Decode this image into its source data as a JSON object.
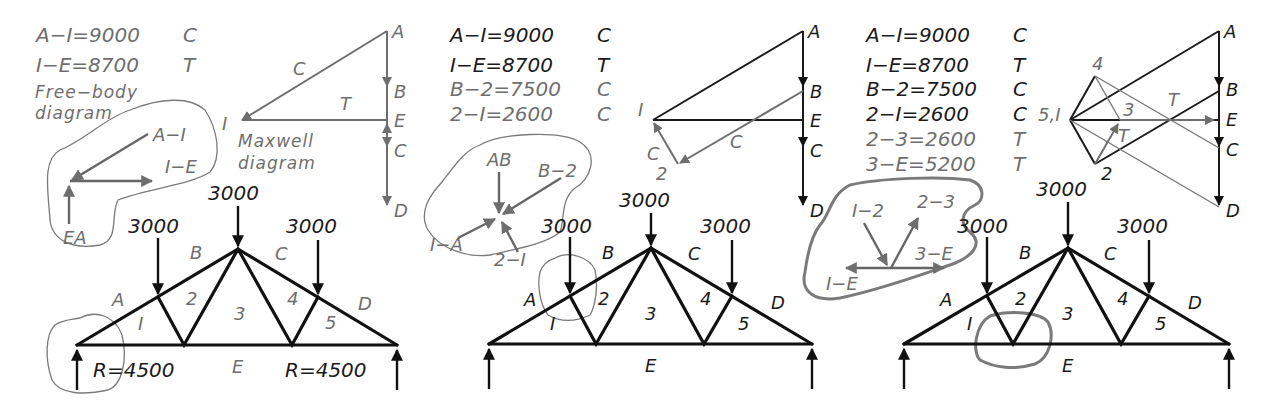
{
  "figure": {
    "colors": {
      "known_members": "#1a1a1a",
      "current_step": "#6e6e6e",
      "background": "#ffffff"
    }
  },
  "panels": [
    {
      "id": "step-1",
      "results": [
        {
          "member": "A-I",
          "value": "A−I=9000",
          "type": "C"
        },
        {
          "member": "I-E",
          "value": "I−E=8700",
          "type": "T"
        }
      ],
      "free_body_caption": [
        "Free−body",
        "diagram"
      ],
      "maxwell_caption": [
        "Maxwell",
        "diagram"
      ],
      "free_body_labels": {
        "a": "A−I",
        "b": "I−E",
        "c": "EA"
      },
      "maxwell_labels": {
        "A": "A",
        "B": "B",
        "E": "E",
        "C": "C",
        "D": "D",
        "I": "I",
        "c_mark": "C",
        "t_mark": "T"
      },
      "truss": {
        "loads": [
          "3000",
          "3000",
          "3000"
        ],
        "reactions": [
          "R=4500",
          "R=4500"
        ],
        "space_labels": {
          "A": "A",
          "B": "B",
          "C": "C",
          "D": "D",
          "E": "E"
        },
        "panel_labels": [
          "I",
          "2",
          "3",
          "4",
          "5"
        ]
      }
    },
    {
      "id": "step-2",
      "results": [
        {
          "member": "A-I",
          "value": "A−I=9000",
          "type": "C"
        },
        {
          "member": "I-E",
          "value": "I−E=8700",
          "type": "T"
        },
        {
          "member": "B-2",
          "value": "B−2=7500",
          "type": "C"
        },
        {
          "member": "2-I",
          "value": "2−I=2600",
          "type": "C"
        }
      ],
      "free_body_labels": {
        "a": "AB",
        "b": "B−2",
        "c": "I−A",
        "d": "2−I"
      },
      "maxwell_labels": {
        "A": "A",
        "B": "B",
        "E": "E",
        "C": "C",
        "D": "D",
        "I": "I",
        "two": "2",
        "c_mark1": "C",
        "c_mark2": "C"
      },
      "truss": {
        "loads": [
          "3000",
          "3000",
          "3000"
        ],
        "space_labels": {
          "A": "A",
          "B": "B",
          "C": "C",
          "D": "D",
          "E": "E"
        },
        "panel_labels": [
          "I",
          "2",
          "3",
          "4",
          "5"
        ]
      }
    },
    {
      "id": "step-3",
      "results": [
        {
          "member": "A-I",
          "value": "A−I=9000",
          "type": "C"
        },
        {
          "member": "I-E",
          "value": "I−E=8700",
          "type": "T"
        },
        {
          "member": "B-2",
          "value": "B−2=7500",
          "type": "C"
        },
        {
          "member": "2-I",
          "value": "2−I=2600",
          "type": "C"
        },
        {
          "member": "2-3",
          "value": "2−3=2600",
          "type": "T"
        },
        {
          "member": "3-E",
          "value": "3−E=5200",
          "type": "T"
        }
      ],
      "free_body_labels": {
        "a": "I−2",
        "b": "2−3",
        "c": "3−E",
        "d": "I−E"
      },
      "maxwell_labels": {
        "A": "A",
        "B": "B",
        "E": "E",
        "C": "C",
        "D": "D",
        "origin": "5,I",
        "four": "4",
        "three": "3",
        "two": "2",
        "t_mark1": "T",
        "t_mark2": "T"
      },
      "truss": {
        "loads": [
          "3000",
          "3000",
          "3000"
        ],
        "space_labels": {
          "A": "A",
          "B": "B",
          "C": "C",
          "D": "D",
          "E": "E"
        },
        "panel_labels": [
          "I",
          "2",
          "3",
          "4",
          "5"
        ]
      }
    }
  ]
}
